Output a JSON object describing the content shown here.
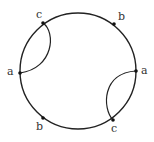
{
  "diagram": {
    "type": "chord-circle",
    "circle": {
      "cx": 78,
      "cy": 71,
      "r": 58
    },
    "points": [
      {
        "id": "c1",
        "label": "c",
        "x": 43,
        "y": 23,
        "lx": 36,
        "ly": 18
      },
      {
        "id": "b1",
        "label": "b",
        "x": 114,
        "y": 24,
        "lx": 118,
        "ly": 20
      },
      {
        "id": "a1",
        "label": "a",
        "x": 20,
        "y": 73,
        "lx": 7,
        "ly": 75
      },
      {
        "id": "a2",
        "label": "a",
        "x": 136,
        "y": 71,
        "lx": 141,
        "ly": 74
      },
      {
        "id": "b2",
        "label": "b",
        "x": 43,
        "y": 118,
        "lx": 36,
        "ly": 130
      },
      {
        "id": "c2",
        "label": "c",
        "x": 113,
        "y": 120,
        "lx": 111,
        "ly": 132
      }
    ],
    "arcs": [
      {
        "from": "c1",
        "to": "a1"
      },
      {
        "from": "a2",
        "to": "c2"
      }
    ]
  }
}
